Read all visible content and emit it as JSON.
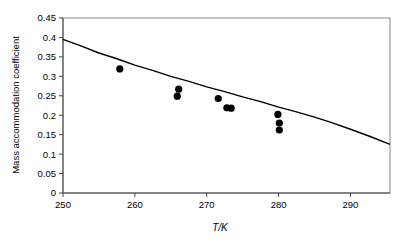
{
  "chart_data": {
    "type": "scatter",
    "title": "",
    "xlabel": "T/K",
    "ylabel": "Mass accommodation coefficient",
    "xlim": [
      250,
      295.5
    ],
    "ylim": [
      0,
      0.45
    ],
    "grid": false,
    "legend": "none",
    "xticks": [
      250,
      260,
      270,
      280,
      290
    ],
    "xtick_labels": [
      "250",
      "260",
      "270",
      "280",
      "290"
    ],
    "yticks": [
      0,
      0.05,
      0.1,
      0.15,
      0.2,
      0.25,
      0.3,
      0.35,
      0.4,
      0.45
    ],
    "ytick_labels": [
      "0",
      "0.05",
      "0.1",
      "0.15",
      "0.2",
      "0.25",
      "0.3",
      "0.35",
      "0.4",
      "0.45"
    ],
    "series": [
      {
        "name": "measurements",
        "type": "scatter",
        "marker": "filled-circle",
        "color": "#000000",
        "points": [
          {
            "x": 257.9,
            "y": 0.319
          },
          {
            "x": 266.1,
            "y": 0.267
          },
          {
            "x": 265.9,
            "y": 0.249
          },
          {
            "x": 271.6,
            "y": 0.243
          },
          {
            "x": 272.8,
            "y": 0.219
          },
          {
            "x": 273.4,
            "y": 0.218
          },
          {
            "x": 279.9,
            "y": 0.202
          },
          {
            "x": 280.1,
            "y": 0.18
          },
          {
            "x": 280.1,
            "y": 0.162
          }
        ]
      },
      {
        "name": "fit-curve",
        "type": "line",
        "color": "#000000",
        "points": [
          {
            "x": 250.0,
            "y": 0.395
          },
          {
            "x": 255.0,
            "y": 0.36
          },
          {
            "x": 260.0,
            "y": 0.329
          },
          {
            "x": 265.0,
            "y": 0.3
          },
          {
            "x": 270.0,
            "y": 0.273
          },
          {
            "x": 275.0,
            "y": 0.247
          },
          {
            "x": 280.0,
            "y": 0.221
          },
          {
            "x": 285.0,
            "y": 0.195
          },
          {
            "x": 290.0,
            "y": 0.164
          },
          {
            "x": 295.5,
            "y": 0.125
          }
        ]
      }
    ]
  }
}
